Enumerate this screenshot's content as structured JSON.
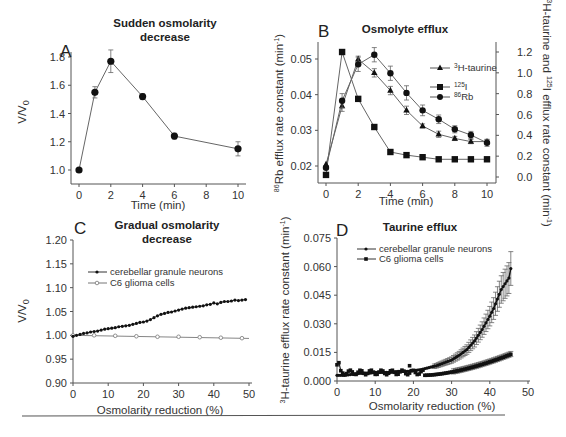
{
  "figure": {
    "separator_color": "#555555"
  },
  "chart_data": [
    {
      "panel": "A",
      "type": "line",
      "title": "Sudden osmolarity decrease",
      "title_lines": [
        "Sudden osmolarity",
        "decrease"
      ],
      "xlabel": "Time (min)",
      "ylabel": "V/V0",
      "xlim": [
        0,
        10
      ],
      "ylim": [
        1.0,
        1.8
      ],
      "xticks": [
        "0",
        "2",
        "4",
        "6",
        "8",
        "10"
      ],
      "yticks": [
        "1.0",
        "1.2",
        "1.4",
        "1.6",
        "1.8"
      ],
      "series": [
        {
          "name": "V/V0",
          "x": [
            0,
            1,
            2,
            4,
            6,
            10
          ],
          "values": [
            1.0,
            1.55,
            1.77,
            1.52,
            1.24,
            1.15
          ],
          "err": [
            0.0,
            0.04,
            0.08,
            0.02,
            0.02,
            0.05
          ]
        }
      ],
      "grid": false
    },
    {
      "panel": "B",
      "type": "line",
      "title": "Osmolyte efflux",
      "xlabel": "Time (min)",
      "ylabel": "86Rb efflux rate constant (min-1)",
      "ylabel_right": "3H-taurine and 125I efflux rate constant (min-1)",
      "xlim": [
        0,
        10
      ],
      "ylim": [
        0.02,
        0.05
      ],
      "ylim_right": [
        0.0,
        1.2
      ],
      "xticks": [
        "0",
        "2",
        "4",
        "6",
        "8",
        "10"
      ],
      "yticks": [
        "0.02",
        "0.03",
        "0.04",
        "0.05"
      ],
      "yticks_right": [
        "0.0",
        "0.2",
        "0.4",
        "0.6",
        "0.8",
        "1.0",
        "1.2"
      ],
      "legend": [
        "3H-taurine",
        "125I",
        "86Rb"
      ],
      "legend_position": "upper right",
      "series": [
        {
          "name": "3H-taurine",
          "axis": "right",
          "marker": "triangle",
          "x": [
            0,
            1,
            2,
            3,
            4,
            5,
            6,
            7,
            8,
            9,
            10
          ],
          "values": [
            0.12,
            0.68,
            1.13,
            1.0,
            0.83,
            0.64,
            0.49,
            0.41,
            0.37,
            0.34,
            0.34
          ],
          "err": [
            0,
            0.05,
            0.03,
            0.04,
            0.04,
            0.04,
            0.02,
            0.03,
            0.02,
            0.02,
            0.02
          ]
        },
        {
          "name": "125I",
          "axis": "right",
          "marker": "square",
          "x": [
            0,
            1,
            2,
            3,
            4,
            5,
            6,
            7,
            8,
            9,
            10
          ],
          "values": [
            0.02,
            1.2,
            0.75,
            0.48,
            0.24,
            0.21,
            0.19,
            0.17,
            0.17,
            0.17,
            0.17
          ],
          "err": [
            0,
            0,
            0,
            0,
            0,
            0,
            0,
            0,
            0,
            0,
            0
          ]
        },
        {
          "name": "86Rb",
          "axis": "left",
          "marker": "circle",
          "x": [
            0,
            1,
            2,
            3,
            4,
            5,
            6,
            7,
            8,
            9,
            10
          ],
          "values": [
            0.0195,
            0.0383,
            0.0485,
            0.0512,
            0.046,
            0.0405,
            0.0356,
            0.0331,
            0.0303,
            0.0287,
            0.0265
          ],
          "err": [
            0,
            0.002,
            0.002,
            0.002,
            0.002,
            0.002,
            0.0015,
            0.0012,
            0.001,
            0.001,
            0.001
          ]
        }
      ],
      "grid": false
    },
    {
      "panel": "C",
      "type": "line",
      "title": "Gradual osmolarity decrease",
      "title_lines": [
        "Gradual osmolarity",
        "decrease"
      ],
      "xlabel": "Osmolarity reduction (%)",
      "ylabel": "V/V0",
      "xlim": [
        0,
        50
      ],
      "ylim": [
        0.9,
        1.2
      ],
      "xticks": [
        "0",
        "10",
        "20",
        "30",
        "40",
        "50"
      ],
      "yticks": [
        "0.90",
        "0.95",
        "1.00",
        "1.05",
        "1.10",
        "1.15",
        "1.20"
      ],
      "legend": [
        "cerebellar granule neurons",
        "C6 glioma cells"
      ],
      "legend_position": "upper left",
      "series": [
        {
          "name": "cerebellar granule neurons",
          "marker": "filled-circle-small",
          "x": [
            0,
            1,
            2,
            3,
            4,
            5,
            6,
            7,
            8,
            9,
            10,
            11,
            12,
            13,
            14,
            15,
            16,
            17,
            18,
            19,
            20,
            21,
            22,
            23,
            24,
            25,
            26,
            27,
            28,
            29,
            30,
            31,
            32,
            33,
            34,
            35,
            36,
            37,
            38,
            39,
            40,
            41,
            42,
            43,
            44,
            45,
            46,
            47,
            48,
            49
          ],
          "values": [
            0.998,
            1.0,
            1.002,
            1.004,
            1.005,
            1.007,
            1.008,
            1.009,
            1.011,
            1.013,
            1.014,
            1.015,
            1.016,
            1.018,
            1.019,
            1.02,
            1.021,
            1.023,
            1.025,
            1.027,
            1.028,
            1.03,
            1.033,
            1.037,
            1.041,
            1.044,
            1.046,
            1.048,
            1.049,
            1.051,
            1.053,
            1.055,
            1.057,
            1.058,
            1.059,
            1.06,
            1.061,
            1.062,
            1.064,
            1.065,
            1.068,
            1.066,
            1.069,
            1.071,
            1.071,
            1.072,
            1.074,
            1.073,
            1.074,
            1.075
          ]
        },
        {
          "name": "C6 glioma cells",
          "marker": "open-circle",
          "x": [
            0,
            6,
            12,
            18,
            24,
            30,
            36,
            42,
            48
          ],
          "values": [
            1.0,
            1.0,
            0.999,
            0.998,
            0.997,
            0.997,
            0.996,
            0.995,
            0.994
          ]
        }
      ],
      "grid": false
    },
    {
      "panel": "D",
      "type": "line",
      "title": "Taurine efflux",
      "xlabel": "Osmolarity reduction (%)",
      "ylabel": "3H-taurine efflux rate constant (min-1)",
      "xlim": [
        0,
        50
      ],
      "ylim": [
        0.0,
        0.075
      ],
      "xticks": [
        "0",
        "10",
        "20",
        "30",
        "40",
        "50"
      ],
      "yticks": [
        "0.000",
        "0.015",
        "0.030",
        "0.045",
        "0.060",
        "0.075"
      ],
      "legend": [
        "cerebellar granule neurons",
        "C6 glioma cells"
      ],
      "legend_position": "upper left",
      "series": [
        {
          "name": "cerebellar granule neurons",
          "marker": "filled-circle-small",
          "x": [
            0,
            2,
            4,
            6,
            8,
            10,
            12,
            14,
            16,
            18,
            20,
            22,
            24,
            26,
            28,
            30,
            32,
            34,
            36,
            38,
            40,
            41,
            42,
            43,
            44,
            45,
            45.5
          ],
          "values": [
            0.003,
            0.003,
            0.0035,
            0.004,
            0.004,
            0.0045,
            0.0045,
            0.0045,
            0.005,
            0.005,
            0.0055,
            0.006,
            0.007,
            0.008,
            0.0095,
            0.011,
            0.0135,
            0.0165,
            0.021,
            0.027,
            0.034,
            0.038,
            0.043,
            0.048,
            0.051,
            0.054,
            0.059
          ]
        },
        {
          "name": "C6 glioma cells",
          "marker": "filled-square-small",
          "x": [
            0,
            1,
            3,
            5,
            7,
            9,
            11,
            13,
            15,
            17,
            19,
            21,
            23,
            25,
            27,
            29,
            31,
            33,
            35,
            37,
            39,
            41,
            43,
            45
          ],
          "values": [
            0.01,
            0.006,
            0.0055,
            0.005,
            0.0045,
            0.0045,
            0.0055,
            0.0045,
            0.0045,
            0.005,
            0.008,
            0.005,
            0.003,
            0.0035,
            0.004,
            0.0045,
            0.005,
            0.006,
            0.007,
            0.008,
            0.0095,
            0.011,
            0.013,
            0.014
          ]
        }
      ],
      "grid": false
    }
  ]
}
